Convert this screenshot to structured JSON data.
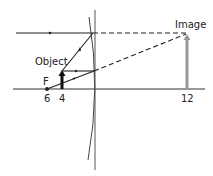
{
  "diagram": {
    "labels": {
      "object": "Object",
      "image": "Image",
      "focal_point": "F"
    },
    "axis_ticks": [
      {
        "label": "6",
        "x": 47
      },
      {
        "label": "4",
        "x": 62
      },
      {
        "label": "12",
        "x": 187
      }
    ],
    "colors": {
      "ray": "#222222",
      "object_arrow": "#111111",
      "image_arrow": "#999999",
      "lens": "#444444",
      "axis": "#333333"
    }
  }
}
